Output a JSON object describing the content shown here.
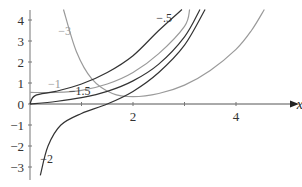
{
  "chart_data": {
    "type": "line",
    "title": "",
    "xlabel": "x",
    "ylabel": "",
    "xlim": [
      0,
      4.7
    ],
    "ylim": [
      -3.4,
      4.5
    ],
    "x_ticks": [
      1,
      2,
      3,
      4
    ],
    "x_tick_labels": [
      "",
      "2",
      "",
      "4"
    ],
    "y_ticks": [
      -3,
      -2,
      -1,
      0,
      1,
      2,
      3,
      4
    ],
    "y_tick_labels": [
      "−3",
      "−2",
      "−1",
      "0",
      "1",
      "2",
      "3",
      "4"
    ],
    "grid": false,
    "legend": "none (inline curve labels)",
    "series": [
      {
        "name": "−3",
        "color": "#9a9a9a",
        "label_pos": [
          0.55,
          3.3
        ],
        "points": [
          [
            0.65,
            4.5
          ],
          [
            0.9,
            2.5
          ],
          [
            1.2,
            1.2
          ],
          [
            1.6,
            0.5
          ],
          [
            2.0,
            0.35
          ],
          [
            2.5,
            0.5
          ],
          [
            3.0,
            0.9
          ],
          [
            3.5,
            1.6
          ],
          [
            4.0,
            2.6
          ],
          [
            4.3,
            3.5
          ],
          [
            4.55,
            4.5
          ]
        ]
      },
      {
        "name": "−1",
        "color": "#9a9a9a",
        "label_pos": [
          0.35,
          0.75
        ],
        "points": [
          [
            0.0,
            0.55
          ],
          [
            0.5,
            0.55
          ],
          [
            1.0,
            0.65
          ],
          [
            1.5,
            0.95
          ],
          [
            2.0,
            1.5
          ],
          [
            2.5,
            2.4
          ],
          [
            3.0,
            3.7
          ],
          [
            3.1,
            4.5
          ]
        ]
      },
      {
        "name": "−1.5",
        "color": "#333333",
        "label_pos": [
          0.75,
          0.45
        ],
        "points": [
          [
            0.0,
            0.0
          ],
          [
            0.5,
            0.12
          ],
          [
            1.0,
            0.3
          ],
          [
            1.5,
            0.6
          ],
          [
            2.0,
            1.1
          ],
          [
            2.5,
            1.9
          ],
          [
            3.0,
            3.2
          ],
          [
            3.3,
            4.5
          ]
        ]
      },
      {
        "name": "−.5",
        "color": "#333333",
        "label_pos": [
          2.45,
          3.9
        ],
        "points": [
          [
            0.0,
            0.0
          ],
          [
            0.1,
            0.4
          ],
          [
            0.5,
            0.6
          ],
          [
            1.0,
            0.95
          ],
          [
            1.5,
            1.5
          ],
          [
            2.0,
            2.3
          ],
          [
            2.5,
            3.5
          ],
          [
            2.95,
            4.5
          ]
        ]
      },
      {
        "name": "−2",
        "color": "#333333",
        "label_pos": [
          0.2,
          -2.8
        ],
        "points": [
          [
            0.2,
            -3.4
          ],
          [
            0.35,
            -2.0
          ],
          [
            0.6,
            -1.0
          ],
          [
            1.0,
            -0.45
          ],
          [
            1.5,
            0.0
          ],
          [
            2.0,
            0.6
          ],
          [
            2.5,
            1.5
          ],
          [
            3.0,
            2.8
          ],
          [
            3.4,
            4.5
          ]
        ]
      }
    ]
  }
}
